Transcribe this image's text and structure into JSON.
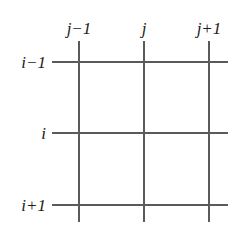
{
  "figure": {
    "kind": "finite-difference-grid-stencil",
    "background_color": "#ffffff",
    "line_color": "#5a5a5a",
    "text_color": "#1b1b1b",
    "column_labels": [
      {
        "text": "j−1",
        "x": 79
      },
      {
        "text": "j",
        "x": 144
      },
      {
        "text": "j+1",
        "x": 209
      }
    ],
    "row_labels": [
      {
        "text": "i−1",
        "y": 62
      },
      {
        "text": "i",
        "y": 133
      },
      {
        "text": "i+1",
        "y": 205
      }
    ],
    "vertical_lines": [
      {
        "x": 79,
        "y_start": 41,
        "y_end": 222
      },
      {
        "x": 144,
        "y_start": 41,
        "y_end": 222
      },
      {
        "x": 209,
        "y_start": 41,
        "y_end": 222
      }
    ],
    "horizontal_lines": [
      {
        "y": 62,
        "x_start": 52,
        "x_end": 228
      },
      {
        "y": 133,
        "x_start": 52,
        "x_end": 228
      },
      {
        "y": 205,
        "x_start": 52,
        "x_end": 228
      }
    ]
  }
}
